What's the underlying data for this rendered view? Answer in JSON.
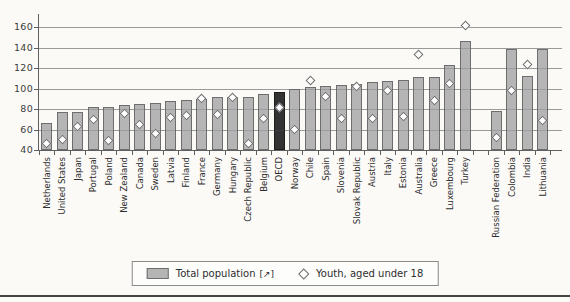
{
  "figure": {
    "legend": {
      "total_label": "Total population",
      "total_suffix": "[↗]",
      "youth_label": "Youth, aged under 18"
    },
    "colors": {
      "bar_fill": "#b5b5b5",
      "bar_border": "#6e6e6e",
      "highlight_fill": "#333333",
      "marker_fill": "#ffffff",
      "grid": "#b2b2b2",
      "text": "#2d2d2d",
      "bottom_rule": "#454545"
    }
  },
  "chart_data": {
    "type": "bar",
    "title": "",
    "xlabel": "",
    "ylabel": "",
    "ylim": [
      40,
      160
    ],
    "yticks": [
      160,
      140,
      120,
      100,
      80,
      60,
      40
    ],
    "grid": true,
    "legend_position": "bottom",
    "highlighted_category": "OECD",
    "categories": [
      "Netherlands",
      "United States",
      "Japan",
      "Portugal",
      "Poland",
      "New Zealand",
      "Canada",
      "Sweden",
      "Latvia",
      "Finland",
      "France",
      "Germany",
      "Hungary",
      "Czech Republic",
      "Belgium",
      "OECD",
      "Norway",
      "Chile",
      "Spain",
      "Slovenia",
      "Slovak Republic",
      "Austria",
      "Italy",
      "Estonia",
      "Australia",
      "Greece",
      "Luxembourg",
      "Turkey",
      "",
      "Russian Federation",
      "Colombia",
      "India",
      "Lithuania"
    ],
    "series": [
      {
        "name": "Total population",
        "style": "bar",
        "values": [
          66,
          77,
          77,
          82,
          82,
          84,
          85,
          86,
          88,
          89,
          90,
          92,
          92,
          92,
          95,
          97,
          100,
          101,
          102,
          103,
          104,
          106,
          107,
          108,
          111,
          111,
          123,
          146,
          null,
          78,
          139,
          112,
          139
        ]
      },
      {
        "name": "Youth, aged under 18",
        "style": "diamond-marker",
        "values": [
          46,
          50,
          63,
          70,
          49,
          76,
          65,
          56,
          72,
          74,
          90,
          75,
          91,
          46,
          71,
          81,
          60,
          108,
          92,
          71,
          102,
          71,
          98,
          73,
          133,
          88,
          105,
          161,
          null,
          52,
          98,
          123,
          69
        ]
      }
    ]
  }
}
